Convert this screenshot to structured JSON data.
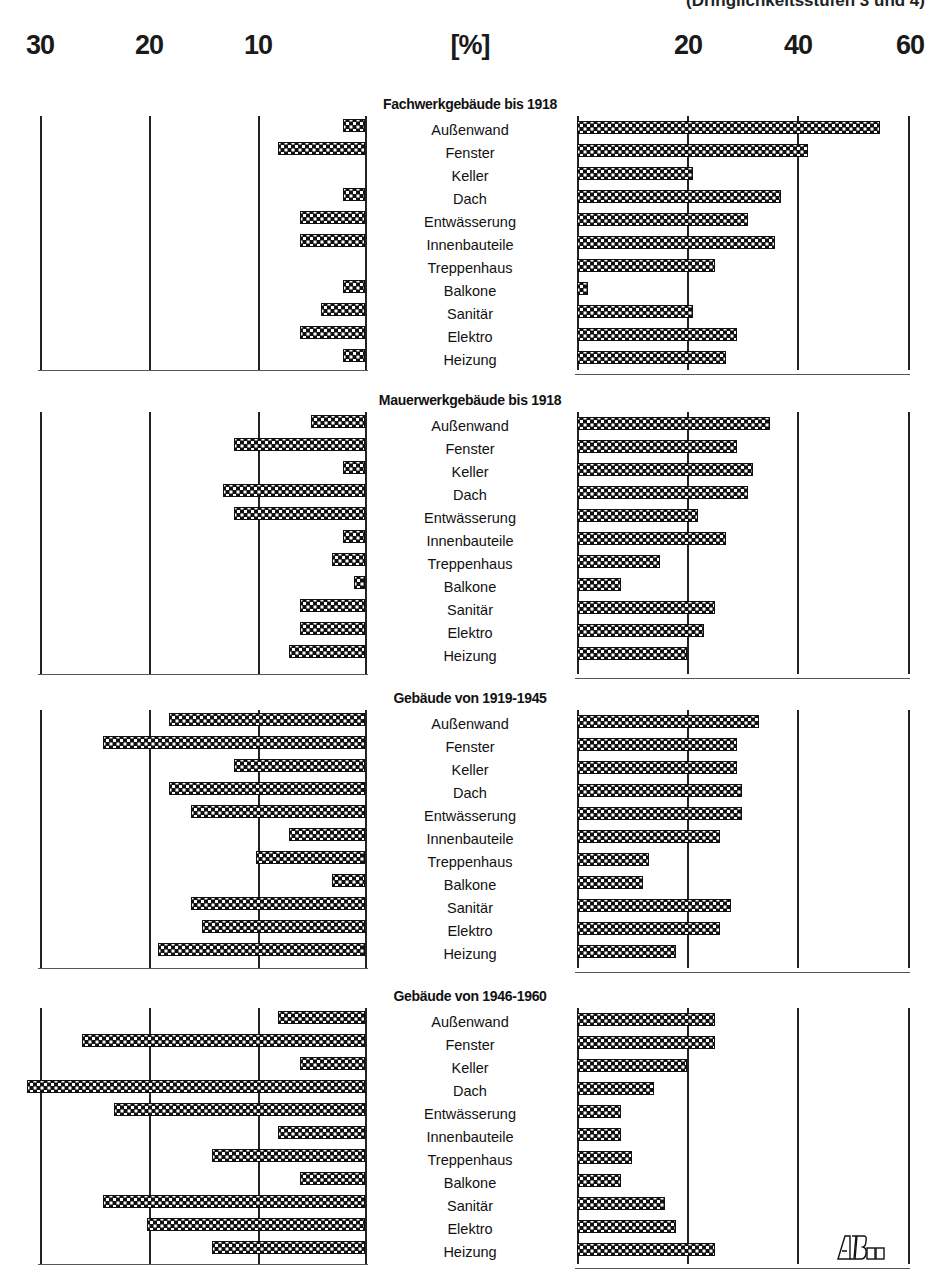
{
  "header": {
    "top_note_partial": "(Dringlichkeitsstufen 3 und 4)",
    "unit_label": "[%]"
  },
  "axis": {
    "left_ticks": [
      "30",
      "20",
      "10"
    ],
    "right_ticks": [
      "20",
      "40",
      "60"
    ]
  },
  "logo_text": "AIBau",
  "chart_data": {
    "type": "bar",
    "orientation": "horizontal-butterfly",
    "unit": "%",
    "xlabel": "[%]",
    "left_axis_range": [
      0,
      30
    ],
    "right_axis_range": [
      0,
      60
    ],
    "grid": true,
    "categories": [
      "Außenwand",
      "Fenster",
      "Keller",
      "Dach",
      "Entwässerung",
      "Innenbauteile",
      "Treppenhaus",
      "Balkone",
      "Sanitär",
      "Elektro",
      "Heizung"
    ],
    "panels": [
      {
        "title": "Fachwerkgebäude bis 1918",
        "left_values": [
          2,
          8,
          0,
          2,
          6,
          6,
          0,
          2,
          4,
          6,
          2
        ],
        "right_values": [
          55,
          42,
          21,
          37,
          31,
          36,
          25,
          2,
          21,
          29,
          27
        ]
      },
      {
        "title": "Mauerwerkgebäude bis 1918",
        "left_values": [
          5,
          12,
          2,
          13,
          12,
          2,
          3,
          1,
          6,
          6,
          7
        ],
        "right_values": [
          35,
          29,
          32,
          31,
          22,
          27,
          15,
          8,
          25,
          23,
          20
        ]
      },
      {
        "title": "Gebäude von 1919-1945",
        "left_values": [
          18,
          24,
          12,
          18,
          16,
          7,
          10,
          3,
          16,
          15,
          19
        ],
        "right_values": [
          33,
          29,
          29,
          30,
          30,
          26,
          13,
          12,
          28,
          26,
          18
        ]
      },
      {
        "title": "Gebäude von 1946-1960",
        "left_values": [
          8,
          26,
          6,
          31,
          23,
          8,
          14,
          6,
          24,
          20,
          14
        ],
        "right_values": [
          25,
          25,
          20,
          14,
          8,
          8,
          10,
          8,
          16,
          18,
          25
        ]
      }
    ]
  }
}
